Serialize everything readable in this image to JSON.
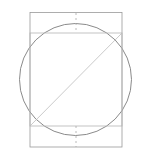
{
  "canvas": {
    "width": 150,
    "height": 158,
    "background_color": "#ffffff",
    "title": "Circle inscribing square within rectangle"
  },
  "colors": {
    "outer_rectangle_stroke": "#9a9a9a",
    "inner_square_stroke": "#b4b4b4",
    "circle_stroke": "#7d7d7d",
    "diagonal_stroke": "#bcbcbc",
    "dashed_stroke": "#a8a8a8"
  },
  "shapes": {
    "outer_rectangle": {
      "name": "outer-rectangle",
      "x": 30,
      "y": 12.5,
      "width": 92,
      "height": 134.5,
      "stroke_width": 0.8,
      "fill": "none"
    },
    "inner_square": {
      "name": "inner-square",
      "x": 30,
      "y": 33,
      "width": 92,
      "height": 93,
      "stroke_width": 0.8,
      "fill": "none"
    },
    "circle": {
      "name": "circumscribed-circle",
      "cx": 75.5,
      "cy": 79.5,
      "r": 56,
      "stroke_width": 0.9,
      "fill": "none"
    },
    "diagonal": {
      "name": "square-diagonal",
      "x1": 30,
      "y1": 126,
      "x2": 122,
      "y2": 33,
      "stroke_width": 0.8
    },
    "dashed_top": {
      "name": "top-offset-dashed-line",
      "x1": 76,
      "y1": 13,
      "x2": 76,
      "y2": 33,
      "stroke_width": 0.8,
      "dash_pattern": "2 3"
    },
    "dashed_bottom": {
      "name": "bottom-offset-dashed-line",
      "x1": 76,
      "y1": 126,
      "x2": 76,
      "y2": 147,
      "stroke_width": 0.8,
      "dash_pattern": "2 3"
    }
  },
  "chart_data": {
    "type": "diagram",
    "elements": [
      {
        "id": "outer-rectangle",
        "label": "Outer rectangle",
        "shape": "rectangle",
        "left": 30,
        "top": 12.5,
        "right": 122,
        "bottom": 147,
        "width": 92,
        "height": 134.5,
        "line_style": "solid"
      },
      {
        "id": "inner-square",
        "label": "Inner square",
        "shape": "square",
        "left": 30,
        "top": 33,
        "right": 122,
        "bottom": 126,
        "width": 92,
        "height": 93,
        "line_style": "solid"
      },
      {
        "id": "circumscribed-circle",
        "label": "Circle through square corners",
        "shape": "circle",
        "center_x": 75.5,
        "center_y": 79.5,
        "radius": 56,
        "diameter": 112,
        "line_style": "solid"
      },
      {
        "id": "square-diagonal",
        "label": "Diagonal of inner square",
        "shape": "line",
        "from_x": 30,
        "from_y": 126,
        "to_x": 122,
        "to_y": 33,
        "line_style": "solid"
      },
      {
        "id": "top-offset-dashed-line",
        "label": "Top vertical offset marker",
        "shape": "line",
        "from_x": 76,
        "from_y": 13,
        "to_x": 76,
        "to_y": 33,
        "length": 20,
        "line_style": "dashed"
      },
      {
        "id": "bottom-offset-dashed-line",
        "label": "Bottom vertical offset marker",
        "shape": "line",
        "from_x": 76,
        "from_y": 126,
        "to_x": 76,
        "to_y": 147,
        "length": 21,
        "line_style": "dashed"
      }
    ],
    "xlim": [
      0,
      150
    ],
    "ylim": [
      0,
      158
    ],
    "grid": false,
    "legend": null,
    "xlabel": "",
    "ylabel": ""
  }
}
